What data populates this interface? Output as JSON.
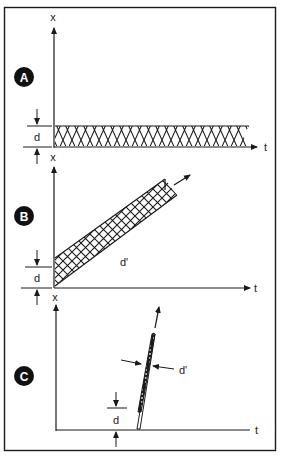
{
  "figure": {
    "panels": [
      {
        "id": "A",
        "badge": "A",
        "axis_x_label": "t",
        "axis_y_label": "x",
        "dimension_label": "d",
        "description": "horizontal hatched band of width d along t axis"
      },
      {
        "id": "B",
        "badge": "B",
        "axis_x_label": "t",
        "axis_y_label": "x",
        "dimension_label": "d",
        "band_label": "d'",
        "description": "inclined hatched band rising with t, arrow pointing up-right"
      },
      {
        "id": "C",
        "badge": "C",
        "axis_x_label": "t",
        "axis_y_label": "x",
        "dimension_label": "d",
        "band_label": "d'",
        "description": "steep narrow hatched band with width d' marked by arrows, arrow pointing up"
      }
    ],
    "colors": {
      "ink": "#1a1a1a",
      "badge_fill": "#111111",
      "background": "#ffffff"
    }
  }
}
